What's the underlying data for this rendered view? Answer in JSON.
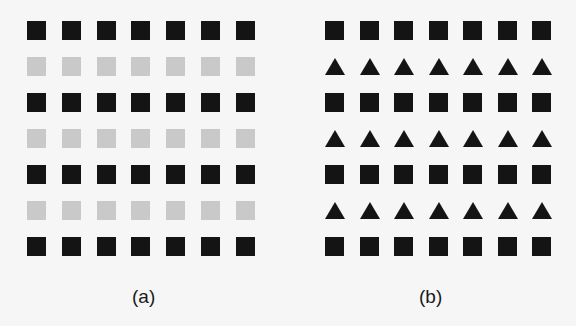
{
  "figure": {
    "panels": [
      {
        "id": "a",
        "label": "(a)",
        "columns": 7,
        "rows": [
          "black-square",
          "gray-square",
          "black-square",
          "gray-square",
          "black-square",
          "gray-square",
          "black-square"
        ]
      },
      {
        "id": "b",
        "label": "(b)",
        "columns": 7,
        "rows": [
          "black-square",
          "black-triangle",
          "black-square",
          "black-triangle",
          "black-square",
          "black-triangle",
          "black-square"
        ]
      }
    ],
    "colors": {
      "black": "#141414",
      "gray": "#c9c9c9",
      "background": "#f6f6f6"
    }
  }
}
